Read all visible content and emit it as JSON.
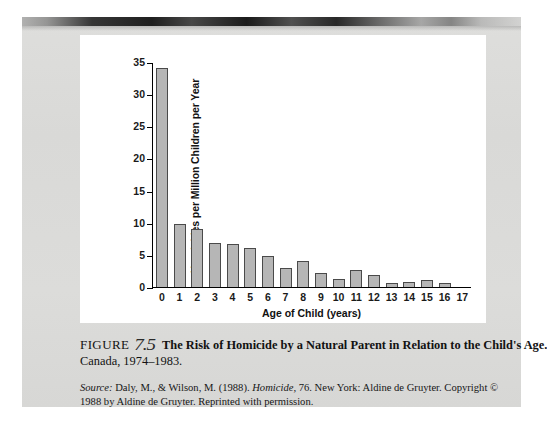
{
  "figure": {
    "label": "FIGURE",
    "number": "7.5",
    "title": "The Risk of Homicide by a Natural Parent in Relation to the Child's Age.",
    "subtitle": "Canada, 1974–1983.",
    "source_prefix": "Source:",
    "source_text_a": " Daly, M., & Wilson, M. (1988). ",
    "source_italic": "Homicide,",
    "source_text_b": " 76. New York: Aldine de Gruyter. Copyright © 1988 by Aldine de Gruyter. Reprinted with permission."
  },
  "chart_data": {
    "type": "bar",
    "title": "The Risk of Homicide by a Natural Parent in Relation to the Child's Age.",
    "xlabel": "Age of Child (years)",
    "ylabel": "Homicides per Million Children per Year",
    "categories": [
      "0",
      "1",
      "2",
      "3",
      "4",
      "5",
      "6",
      "7",
      "8",
      "9",
      "10",
      "11",
      "12",
      "13",
      "14",
      "15",
      "16",
      "17"
    ],
    "values": [
      34,
      9.8,
      9.0,
      6.8,
      6.7,
      6.0,
      4.8,
      3.0,
      4.0,
      2.2,
      1.3,
      2.6,
      1.9,
      0.7,
      0.8,
      1.1,
      0.6,
      0
    ],
    "ylim": [
      0,
      35
    ],
    "yticks": [
      "0",
      "5",
      "10",
      "15",
      "20",
      "25",
      "30",
      "35"
    ],
    "ytick_values": [
      0,
      5,
      10,
      15,
      20,
      25,
      30,
      35
    ],
    "grid": false,
    "legend": "none",
    "bar_fill": "#b6b6b6",
    "bar_edge": "#4a4a4a"
  }
}
